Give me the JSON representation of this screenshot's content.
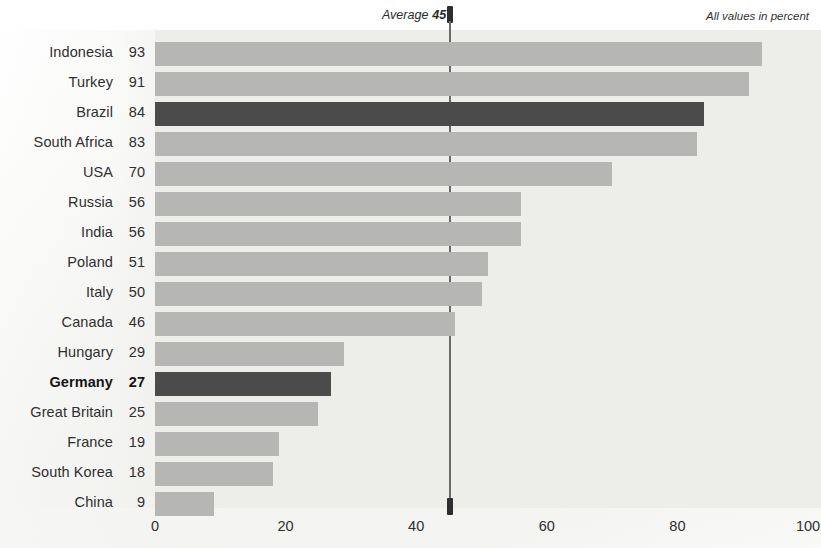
{
  "chart_data": {
    "type": "bar",
    "orientation": "horizontal",
    "title": "",
    "subtitle": "",
    "xlabel": "",
    "ylabel": "",
    "xlim": [
      0,
      100
    ],
    "xticks": [
      "0",
      "20",
      "40",
      "60",
      "80",
      "100"
    ],
    "grid": false,
    "legend": null,
    "units_note": "All values in percent",
    "average": {
      "label": "Average",
      "value": "45",
      "numeric": 45
    },
    "categories": [
      "Indonesia",
      "Turkey",
      "Brazil",
      "South Africa",
      "USA",
      "Russia",
      "India",
      "Poland",
      "Italy",
      "Canada",
      "Hungary",
      "Germany",
      "Great Britain",
      "France",
      "South Korea",
      "China"
    ],
    "values": [
      93,
      91,
      84,
      83,
      70,
      56,
      56,
      51,
      50,
      46,
      29,
      27,
      25,
      19,
      18,
      9
    ],
    "value_labels": [
      "93",
      "91",
      "84",
      "83",
      "70",
      "56",
      "56",
      "51",
      "50",
      "46",
      "29",
      "27",
      "25",
      "19",
      "18",
      "9"
    ],
    "highlighted": [
      "Brazil",
      "Germany"
    ],
    "bold_labels": [
      "Germany"
    ],
    "colors": {
      "bar_default": "#b6b6b4",
      "bar_accent": "#4b4b4b",
      "plot_background": "#ededea",
      "page_background": "#fdfdfc",
      "text": "#2f2f2f",
      "average_line": "#6a6a6a"
    },
    "rows": [
      {
        "label": "Indonesia",
        "value": 93,
        "value_label": "93",
        "accent": false,
        "bold": false
      },
      {
        "label": "Turkey",
        "value": 91,
        "value_label": "91",
        "accent": false,
        "bold": false
      },
      {
        "label": "Brazil",
        "value": 84,
        "value_label": "84",
        "accent": true,
        "bold": false
      },
      {
        "label": "South Africa",
        "value": 83,
        "value_label": "83",
        "accent": false,
        "bold": false
      },
      {
        "label": "USA",
        "value": 70,
        "value_label": "70",
        "accent": false,
        "bold": false
      },
      {
        "label": "Russia",
        "value": 56,
        "value_label": "56",
        "accent": false,
        "bold": false
      },
      {
        "label": "India",
        "value": 56,
        "value_label": "56",
        "accent": false,
        "bold": false
      },
      {
        "label": "Poland",
        "value": 51,
        "value_label": "51",
        "accent": false,
        "bold": false
      },
      {
        "label": "Italy",
        "value": 50,
        "value_label": "50",
        "accent": false,
        "bold": false
      },
      {
        "label": "Canada",
        "value": 46,
        "value_label": "46",
        "accent": false,
        "bold": false
      },
      {
        "label": "Hungary",
        "value": 29,
        "value_label": "29",
        "accent": false,
        "bold": false
      },
      {
        "label": "Germany",
        "value": 27,
        "value_label": "27",
        "accent": true,
        "bold": true
      },
      {
        "label": "Great Britain",
        "value": 25,
        "value_label": "25",
        "accent": false,
        "bold": false
      },
      {
        "label": "France",
        "value": 19,
        "value_label": "19",
        "accent": false,
        "bold": false
      },
      {
        "label": "South Korea",
        "value": 18,
        "value_label": "18",
        "accent": false,
        "bold": false
      },
      {
        "label": "China",
        "value": 9,
        "value_label": "9",
        "accent": false,
        "bold": false
      }
    ]
  }
}
